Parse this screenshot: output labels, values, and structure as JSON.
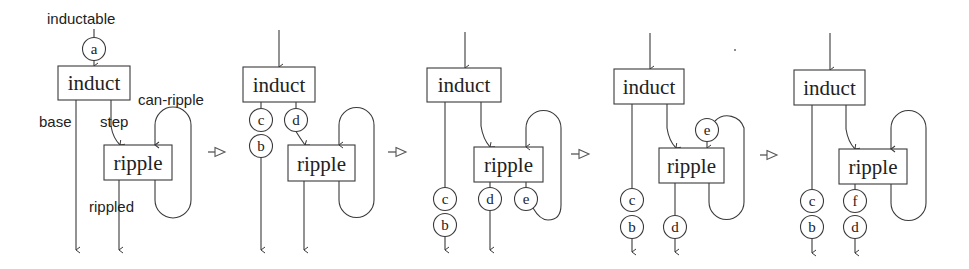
{
  "diagram": {
    "node_labels": {
      "induct": "induct",
      "ripple": "ripple"
    },
    "edge_labels": {
      "inductable": "inductable",
      "base": "base",
      "step": "step",
      "can_ripple": "can-ripple",
      "rippled": "rippled"
    },
    "transition_symbol": "open-triangle-arrow",
    "stages": [
      {
        "index": 1,
        "tokens": [
          {
            "label": "a",
            "position": "inductable input"
          }
        ]
      },
      {
        "index": 2,
        "tokens": [
          {
            "label": "c",
            "position": "base output, upper"
          },
          {
            "label": "b",
            "position": "base output, lower"
          },
          {
            "label": "d",
            "position": "step output"
          }
        ]
      },
      {
        "index": 3,
        "tokens": [
          {
            "label": "c",
            "position": "base output, upper"
          },
          {
            "label": "b",
            "position": "base output, lower"
          },
          {
            "label": "d",
            "position": "rippled output"
          },
          {
            "label": "e",
            "position": "can-ripple output"
          }
        ]
      },
      {
        "index": 4,
        "tokens": [
          {
            "label": "e",
            "position": "can-ripple loop input"
          },
          {
            "label": "c",
            "position": "base output, upper"
          },
          {
            "label": "b",
            "position": "base output, lower"
          },
          {
            "label": "d",
            "position": "rippled output"
          }
        ]
      },
      {
        "index": 5,
        "tokens": [
          {
            "label": "c",
            "position": "base output, upper"
          },
          {
            "label": "b",
            "position": "base output, lower"
          },
          {
            "label": "f",
            "position": "rippled output, upper"
          },
          {
            "label": "d",
            "position": "rippled output, lower"
          }
        ]
      }
    ]
  }
}
